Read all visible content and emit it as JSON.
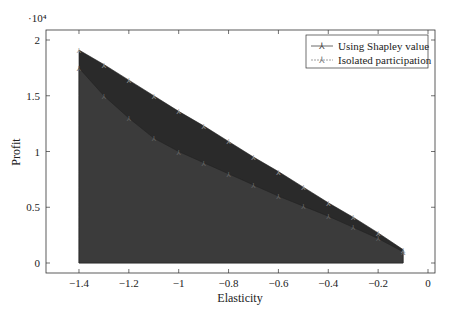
{
  "chart_data": {
    "type": "area",
    "title": "",
    "xlabel": "Elasticity",
    "ylabel": "Profit",
    "y_multiplier_label": "·10⁴",
    "xlim": [
      -1.53,
      0.05
    ],
    "ylim": [
      -0.1,
      2.1
    ],
    "x_ticks": [
      -1.4,
      -1.2,
      -1,
      -0.8,
      -0.6,
      -0.4,
      -0.2,
      0
    ],
    "x_tick_labels": [
      "−1.4",
      "−1.2",
      "−1",
      "−0.8",
      "−0.6",
      "−0.4",
      "−0.2",
      "0"
    ],
    "y_ticks": [
      0,
      0.5,
      1,
      1.5,
      2
    ],
    "y_tick_labels": [
      "0",
      "0.5",
      "1",
      "1.5",
      "2"
    ],
    "grid": false,
    "legend_position": "upper right",
    "x": [
      -1.4,
      -1.3,
      -1.2,
      -1.1,
      -1.0,
      -0.9,
      -0.8,
      -0.7,
      -0.6,
      -0.5,
      -0.4,
      -0.3,
      -0.2,
      -0.1
    ],
    "series": [
      {
        "name": "Using Shapley value",
        "color": "#2b2b2b",
        "values": [
          1.91,
          1.78,
          1.64,
          1.5,
          1.36,
          1.23,
          1.09,
          0.95,
          0.82,
          0.68,
          0.54,
          0.41,
          0.27,
          0.12
        ]
      },
      {
        "name": "Isolated participation",
        "color": "#3a3a3a",
        "values": [
          1.75,
          1.5,
          1.3,
          1.12,
          1.0,
          0.9,
          0.8,
          0.7,
          0.6,
          0.51,
          0.42,
          0.32,
          0.22,
          0.1
        ]
      }
    ]
  }
}
